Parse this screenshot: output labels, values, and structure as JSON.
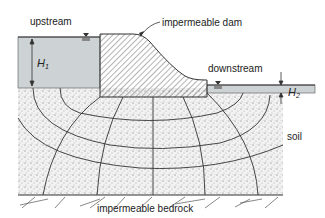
{
  "labels": {
    "upstream": "upstream",
    "dam": "impermeable dam",
    "downstream": "downstream",
    "h1_main": "H",
    "h1_sub": "1",
    "h2_main": "H",
    "h2_sub": "2",
    "soil": "soil",
    "bedrock": "impermeable bedrock"
  },
  "colors": {
    "water": "#cdd3d4",
    "soil": "#efefef",
    "line": "#333333",
    "dam_fill": "#ffffff"
  }
}
